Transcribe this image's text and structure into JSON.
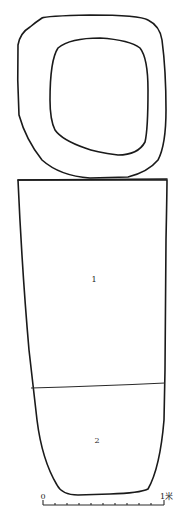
{
  "figure": {
    "type": "archaeological-plan",
    "parts": [
      {
        "id": "outer-ring",
        "label": ""
      },
      {
        "id": "inner-ring",
        "label": ""
      },
      {
        "id": "chamber-section-1",
        "label": "1"
      },
      {
        "id": "chamber-section-2",
        "label": "2"
      }
    ],
    "labels": {
      "section_1": "1",
      "section_2": "2"
    },
    "scale_bar": {
      "start_label": "0",
      "end_label": "1米",
      "ticks": 10
    },
    "colors": {
      "stroke": "#1a1a1a",
      "background": "#ffffff"
    }
  }
}
